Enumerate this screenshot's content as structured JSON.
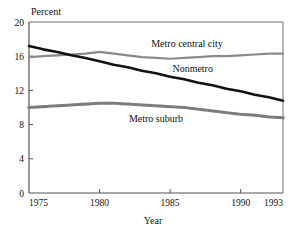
{
  "chart_data": {
    "type": "line",
    "title": "",
    "subtitle": "",
    "xlabel": "Year",
    "ylabel": "Percent",
    "x": [
      1975,
      1976,
      1977,
      1978,
      1979,
      1980,
      1981,
      1982,
      1983,
      1984,
      1985,
      1986,
      1987,
      1988,
      1989,
      1990,
      1991,
      1992,
      1993
    ],
    "xlim": [
      1975,
      1993
    ],
    "ylim": [
      0,
      20
    ],
    "xticks": [
      1975,
      1980,
      1985,
      1990,
      1993
    ],
    "xtick_labels": [
      "1975",
      "1980",
      "1985",
      "1990",
      "1993"
    ],
    "yticks": [
      0,
      4,
      8,
      12,
      16,
      20
    ],
    "ytick_labels": [
      "0",
      "4",
      "8",
      "12",
      "16",
      "20"
    ],
    "grid": false,
    "legend_position": "inline-annotations",
    "series": [
      {
        "name": "Metro central city",
        "style": "solid-gray",
        "color": "#8a8a8a",
        "width": 2.2,
        "label_x": 1986.2,
        "label_y": 17.1,
        "values": [
          15.9,
          16.0,
          16.1,
          16.2,
          16.3,
          16.5,
          16.3,
          16.1,
          15.9,
          15.8,
          15.7,
          15.8,
          15.9,
          16.0,
          16.0,
          16.1,
          16.2,
          16.3,
          16.3
        ]
      },
      {
        "name": "Nonmetro",
        "style": "solid-black",
        "color": "#111111",
        "width": 2.6,
        "label_x": 1986.6,
        "label_y": 14.1,
        "values": [
          17.2,
          16.8,
          16.5,
          16.1,
          15.8,
          15.4,
          15.0,
          14.7,
          14.3,
          14.0,
          13.6,
          13.3,
          12.9,
          12.6,
          12.2,
          11.9,
          11.5,
          11.2,
          10.8
        ]
      },
      {
        "name": "Metro suburb",
        "style": "dotted-gray",
        "color": "#7c7c7c",
        "width": 3.0,
        "label_x": 1984.0,
        "label_y": 8.3,
        "values": [
          10.0,
          10.1,
          10.2,
          10.3,
          10.4,
          10.5,
          10.5,
          10.4,
          10.3,
          10.2,
          10.1,
          10.0,
          9.8,
          9.6,
          9.4,
          9.2,
          9.1,
          8.9,
          8.8
        ]
      }
    ]
  }
}
